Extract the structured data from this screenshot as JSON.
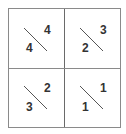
{
  "diagram": {
    "type": "2x2 split-cell grid",
    "cells": [
      {
        "position": "top-left",
        "upper": "4",
        "lower": "4"
      },
      {
        "position": "top-right",
        "upper": "3",
        "lower": "2"
      },
      {
        "position": "bottom-left",
        "upper": "2",
        "lower": "3"
      },
      {
        "position": "bottom-right",
        "upper": "1",
        "lower": "1"
      }
    ],
    "colors": {
      "border": "#8a8a8a",
      "diagonal": "#555555",
      "text": "#333333"
    }
  }
}
